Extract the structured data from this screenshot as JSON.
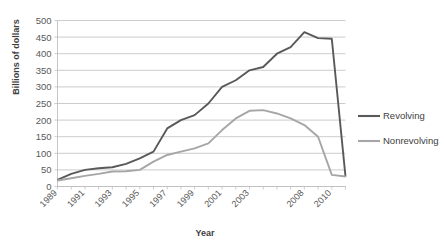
{
  "chart_data": {
    "type": "line",
    "title": "",
    "xlabel": "Year",
    "ylabel": "Billions of dollars",
    "ylim": [
      0,
      500
    ],
    "ytick_step": 50,
    "yticks": [
      0,
      50,
      100,
      150,
      200,
      250,
      300,
      350,
      400,
      450,
      500
    ],
    "grid": true,
    "legend_position": "right",
    "x": [
      1989,
      1990,
      1991,
      1992,
      1993,
      1994,
      1995,
      1996,
      1997,
      1998,
      1999,
      2000,
      2001,
      2002,
      2003,
      2004,
      2005,
      2006,
      2008,
      2009,
      2010,
      2011
    ],
    "xtick_labels": [
      "1989",
      "",
      "1991",
      "",
      "1993",
      "",
      "1995",
      "",
      "1997",
      "",
      "1999",
      "",
      "2001",
      "",
      "2003",
      "",
      "",
      "",
      "2008",
      "",
      "2010",
      ""
    ],
    "xtick_labels_shown": [
      "1989",
      "1991",
      "1993",
      "1995",
      "1997",
      "1999",
      "2001",
      "2003",
      "2008",
      "2010"
    ],
    "series": [
      {
        "name": "Revolving",
        "color": "#595959",
        "values": [
          20,
          38,
          50,
          55,
          58,
          68,
          85,
          105,
          175,
          200,
          215,
          250,
          300,
          320,
          350,
          360,
          400,
          420,
          465,
          447,
          445,
          30
        ]
      },
      {
        "name": "Nonrevolving",
        "color": "#a6a6a6",
        "values": [
          18,
          25,
          32,
          38,
          45,
          46,
          50,
          75,
          95,
          105,
          115,
          130,
          170,
          205,
          228,
          230,
          220,
          205,
          185,
          150,
          35,
          30
        ]
      }
    ]
  },
  "legend": {
    "items": [
      {
        "label": "Revolving",
        "color": "#595959"
      },
      {
        "label": "Nonrevolving",
        "color": "#a6a6a6"
      }
    ]
  },
  "axis": {
    "y_title": "Billions of dollars",
    "x_title": "Year"
  }
}
